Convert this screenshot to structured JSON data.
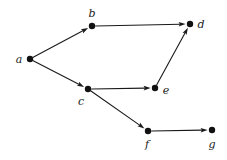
{
  "diagram": {
    "type": "directed-graph",
    "title": "",
    "background_color": "#ffffff",
    "node_color": "#111111",
    "edge_color": "#1a1a1a",
    "label_color": "#1a1a1a",
    "node_radius": 3.2,
    "edge_width": 1.1,
    "width": 227,
    "height": 160,
    "nodes": [
      {
        "id": "a",
        "label": "a",
        "x": 30,
        "y": 59,
        "label_x": 19,
        "label_y": 59
      },
      {
        "id": "b",
        "label": "b",
        "x": 92,
        "y": 26,
        "label_x": 92,
        "label_y": 13
      },
      {
        "id": "c",
        "label": "c",
        "x": 88,
        "y": 89,
        "label_x": 81,
        "label_y": 101
      },
      {
        "id": "d",
        "label": "d",
        "x": 190,
        "y": 24,
        "label_x": 201,
        "label_y": 24
      },
      {
        "id": "e",
        "label": "e",
        "x": 155,
        "y": 88,
        "label_x": 166,
        "label_y": 90
      },
      {
        "id": "f",
        "label": "f",
        "x": 148,
        "y": 131,
        "label_x": 147,
        "label_y": 144
      },
      {
        "id": "g",
        "label": "g",
        "x": 212,
        "y": 130,
        "label_x": 212,
        "label_y": 144
      }
    ],
    "edges": [
      {
        "id": "a-b",
        "from": "a",
        "to": "b",
        "directed": true
      },
      {
        "id": "a-c",
        "from": "a",
        "to": "c",
        "directed": true
      },
      {
        "id": "b-d",
        "from": "b",
        "to": "d",
        "directed": true
      },
      {
        "id": "c-e",
        "from": "c",
        "to": "e",
        "directed": true
      },
      {
        "id": "c-f",
        "from": "c",
        "to": "f",
        "directed": true
      },
      {
        "id": "e-d",
        "from": "e",
        "to": "d",
        "directed": true
      },
      {
        "id": "f-g",
        "from": "f",
        "to": "g",
        "directed": true
      }
    ]
  }
}
